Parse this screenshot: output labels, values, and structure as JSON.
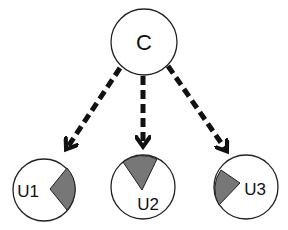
{
  "diagram": {
    "nodes": [
      {
        "id": "C",
        "label": "C",
        "cx": 144,
        "cy": 42,
        "r": 33,
        "label_x": 144,
        "label_y": 50,
        "font_size": 22
      },
      {
        "id": "U1",
        "label": "U1",
        "cx": 44,
        "cy": 190,
        "r": 31,
        "label_x": 28,
        "label_y": 197,
        "font_size": 17
      },
      {
        "id": "U2",
        "label": "U2",
        "cx": 143,
        "cy": 187,
        "r": 32,
        "label_x": 148,
        "label_y": 210,
        "font_size": 17
      },
      {
        "id": "U3",
        "label": "U3",
        "cx": 246,
        "cy": 187,
        "r": 32,
        "label_x": 255,
        "label_y": 195,
        "font_size": 17
      }
    ],
    "wedges": [
      {
        "node": "U1",
        "path": "M50,189 L67,168 A31,31 0 0 1 67,210 Z"
      },
      {
        "node": "U2",
        "path": "M142,190 L123,162 A32,32 0 0 1 157,159 Z"
      },
      {
        "node": "U3",
        "path": "M240,183 L221,170 A32,32 0 0 0 219,205 Z"
      }
    ],
    "edges": [
      {
        "from": "C",
        "to": "U1",
        "x1": 120,
        "y1": 68,
        "x2": 67,
        "y2": 148
      },
      {
        "from": "C",
        "to": "U2",
        "x1": 143,
        "y1": 76,
        "x2": 143,
        "y2": 145
      },
      {
        "from": "C",
        "to": "U3",
        "x1": 168,
        "y1": 66,
        "x2": 226,
        "y2": 150
      }
    ],
    "colors": {
      "node_stroke": "#222222",
      "node_fill": "#ffffff",
      "wedge_fill": "#777777",
      "edge": "#111111"
    }
  }
}
